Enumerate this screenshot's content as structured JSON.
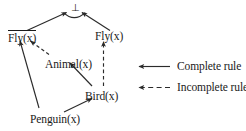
{
  "diagram": {
    "type": "inference-graph",
    "apex": {
      "symbol": "⊥",
      "name": "falsum"
    },
    "nodes": [
      {
        "id": "not-fly",
        "label": "Fly(x)",
        "negated": true,
        "x": 8,
        "y": 30
      },
      {
        "id": "fly",
        "label": "Fly(x)",
        "negated": false,
        "x": 95,
        "y": 30
      },
      {
        "id": "animal",
        "label": "Animal(x)",
        "negated": false,
        "x": 45,
        "y": 58
      },
      {
        "id": "bird",
        "label": "Bird(x)",
        "negated": false,
        "x": 85,
        "y": 90
      },
      {
        "id": "penguin",
        "label": "Penguin(x)",
        "negated": false,
        "x": 30,
        "y": 113
      }
    ],
    "edges": [
      {
        "from": "not-fly",
        "to": "apex",
        "style": "solid"
      },
      {
        "from": "fly",
        "to": "apex",
        "style": "solid"
      },
      {
        "from": "animal",
        "to": "not-fly",
        "style": "dashed"
      },
      {
        "from": "penguin",
        "to": "not-fly",
        "style": "solid"
      },
      {
        "from": "bird",
        "to": "fly",
        "style": "dashed"
      },
      {
        "from": "bird",
        "to": "animal",
        "style": "solid"
      },
      {
        "from": "penguin",
        "to": "bird",
        "style": "solid"
      }
    ]
  },
  "legend": {
    "items": [
      {
        "id": "complete",
        "label": "Complete rule",
        "style": "solid"
      },
      {
        "id": "incomplete",
        "label": "Incomplete rule",
        "style": "dashed"
      }
    ]
  },
  "colors": {
    "background": "#ffffff",
    "ink": "#1a1a1a",
    "stroke": "#2b2b2b"
  }
}
